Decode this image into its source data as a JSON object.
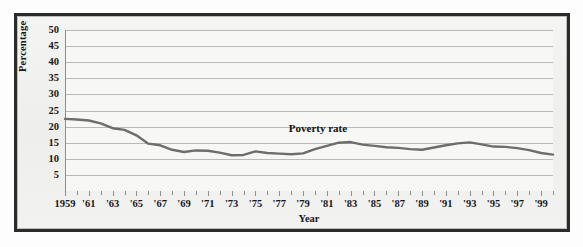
{
  "figure": {
    "background_color": "#fdfdfd",
    "frame_color": "#2b2b2b",
    "plot_background": "#f7f7f5",
    "gridline_color": "#b9b9b5"
  },
  "axes": {
    "y_axis_label": "Percentage",
    "x_axis_label": "Year",
    "y_ticks": [
      "5",
      "10",
      "15",
      "20",
      "25",
      "30",
      "35",
      "40",
      "45",
      "50"
    ],
    "x_ticks": [
      "1959",
      "'61",
      "'63",
      "'65",
      "'67",
      "'69",
      "'71",
      "'73",
      "'75",
      "'77",
      "'79",
      "'81",
      "'83",
      "'85",
      "'87",
      "'89",
      "'91",
      "'93",
      "'95",
      "'97",
      "'99"
    ]
  },
  "annotation": {
    "series_label": "Poverty rate"
  },
  "chart_data": {
    "type": "line",
    "title": "",
    "subtitle": "",
    "xlabel": "Year",
    "ylabel": "Percentage",
    "xlim": [
      1959,
      2000
    ],
    "ylim": [
      0,
      50
    ],
    "grid": true,
    "legend_position": "inline-annotation",
    "line_color": "#6d6d6d",
    "line_width": 2.4,
    "annotations": [
      {
        "text": "Poverty rate",
        "x": 1981,
        "y": 18.8
      }
    ],
    "x_tick_labels": [
      "1959",
      "'61",
      "'63",
      "'65",
      "'67",
      "'69",
      "'71",
      "'73",
      "'75",
      "'77",
      "'79",
      "'81",
      "'83",
      "'85",
      "'87",
      "'89",
      "'91",
      "'93",
      "'95",
      "'97",
      "'99"
    ],
    "y_tick_labels": [
      "5",
      "10",
      "15",
      "20",
      "25",
      "30",
      "35",
      "40",
      "45",
      "50"
    ],
    "series": [
      {
        "name": "Poverty rate",
        "x": [
          1959,
          1960,
          1961,
          1962,
          1963,
          1964,
          1965,
          1966,
          1967,
          1968,
          1969,
          1970,
          1971,
          1972,
          1973,
          1974,
          1975,
          1976,
          1977,
          1978,
          1979,
          1980,
          1981,
          1982,
          1983,
          1984,
          1985,
          1986,
          1987,
          1988,
          1989,
          1990,
          1991,
          1992,
          1993,
          1994,
          1995,
          1996,
          1997,
          1998,
          1999,
          2000
        ],
        "values": [
          22.4,
          22.2,
          21.9,
          21.0,
          19.5,
          19.0,
          17.3,
          14.7,
          14.2,
          12.8,
          12.1,
          12.6,
          12.5,
          11.9,
          11.1,
          11.2,
          12.3,
          11.8,
          11.6,
          11.4,
          11.7,
          13.0,
          14.0,
          15.0,
          15.2,
          14.4,
          14.0,
          13.6,
          13.4,
          13.0,
          12.8,
          13.5,
          14.2,
          14.8,
          15.1,
          14.5,
          13.8,
          13.7,
          13.3,
          12.7,
          11.8,
          11.3
        ]
      }
    ]
  }
}
